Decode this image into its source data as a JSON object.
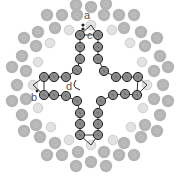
{
  "figure": {
    "labels": [
      {
        "id": "a",
        "text": "a",
        "x": 84,
        "y": 19
      },
      {
        "id": "b",
        "text": "b",
        "x": 31,
        "y": 101
      },
      {
        "id": "c",
        "text": "c",
        "x": 87,
        "y": 39
      },
      {
        "id": "d",
        "text": "d",
        "x": 66,
        "y": 90
      }
    ],
    "colors": {
      "outer_bead": "#b4b4b4",
      "outer_bead_glyph": "#c8c8c8",
      "pale_bead": "#e2e2e2",
      "pale_bead_stroke": "#c4c4c4",
      "chain_bead": "#8a8a8a",
      "chain_bead_stroke": "#222222",
      "chain_link": "#333333",
      "label": "#555555"
    },
    "chain_beads": [
      [
        80,
        35
      ],
      [
        80,
        47
      ],
      [
        80,
        59
      ],
      [
        77,
        70
      ],
      [
        66,
        77
      ],
      [
        54,
        77
      ],
      [
        44,
        77
      ],
      [
        44,
        95
      ],
      [
        54,
        95
      ],
      [
        66,
        96
      ],
      [
        77,
        101
      ],
      [
        80,
        113
      ],
      [
        80,
        124
      ],
      [
        80,
        135
      ],
      [
        98,
        135
      ],
      [
        98,
        124
      ],
      [
        98,
        113
      ],
      [
        101,
        101
      ],
      [
        113,
        95
      ],
      [
        125,
        94
      ],
      [
        137,
        95
      ],
      [
        138,
        77
      ],
      [
        127,
        77
      ],
      [
        116,
        77
      ],
      [
        104,
        71
      ],
      [
        98,
        59
      ],
      [
        98,
        47
      ],
      [
        98,
        35
      ]
    ],
    "pale_beads": [
      [
        91,
        25
      ],
      [
        33,
        85
      ],
      [
        147,
        85
      ],
      [
        91,
        145
      ],
      [
        69,
        30
      ],
      [
        112,
        30
      ],
      [
        50,
        43
      ],
      [
        130,
        43
      ],
      [
        38,
        62
      ],
      [
        142,
        62
      ],
      [
        38,
        108
      ],
      [
        143,
        108
      ],
      [
        51,
        127
      ],
      [
        131,
        127
      ],
      [
        69,
        140
      ],
      [
        113,
        140
      ]
    ],
    "outer_beads": [
      [
        76,
        5
      ],
      [
        91,
        7
      ],
      [
        106,
        4
      ],
      [
        47,
        15
      ],
      [
        62,
        15
      ],
      [
        77,
        15
      ],
      [
        104,
        15
      ],
      [
        119,
        15
      ],
      [
        134,
        15
      ],
      [
        38,
        32
      ],
      [
        55,
        28
      ],
      [
        124,
        28
      ],
      [
        141,
        32
      ],
      [
        24,
        38
      ],
      [
        36,
        46
      ],
      [
        145,
        46
      ],
      [
        157,
        38
      ],
      [
        22,
        56
      ],
      [
        160,
        56
      ],
      [
        12,
        67
      ],
      [
        26,
        71
      ],
      [
        154,
        71
      ],
      [
        168,
        67
      ],
      [
        17,
        85
      ],
      [
        163,
        85
      ],
      [
        12,
        101
      ],
      [
        26,
        99
      ],
      [
        154,
        99
      ],
      [
        168,
        101
      ],
      [
        22,
        115
      ],
      [
        160,
        115
      ],
      [
        24,
        131
      ],
      [
        36,
        125
      ],
      [
        145,
        125
      ],
      [
        157,
        131
      ],
      [
        40,
        137
      ],
      [
        55,
        143
      ],
      [
        124,
        143
      ],
      [
        141,
        137
      ],
      [
        47,
        155
      ],
      [
        62,
        155
      ],
      [
        78,
        152
      ],
      [
        104,
        152
      ],
      [
        119,
        155
      ],
      [
        134,
        155
      ],
      [
        76,
        166
      ],
      [
        91,
        162
      ],
      [
        106,
        166
      ]
    ]
  }
}
